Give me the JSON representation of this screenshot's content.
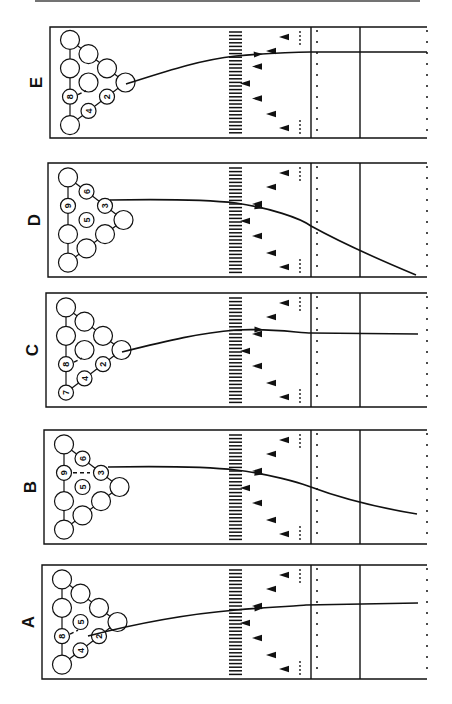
{
  "figure": {
    "top_rule": true,
    "panels": [
      {
        "id": "E",
        "label": "E",
        "top": 27,
        "bottom": 138,
        "left": 50,
        "pins_labeled": {
          "8": "8",
          "4": "4",
          "2": "2"
        },
        "pins_standing": [
          "10",
          "9",
          "8",
          "6",
          "5",
          "4",
          "3",
          "2",
          "1"
        ],
        "path": "M126,84 C170,70 200,60 236,56 C270,53 300,52 311,52 L427,52",
        "deflection": "dash 8→5"
      },
      {
        "id": "D",
        "label": "D",
        "top": 163,
        "bottom": 277,
        "left": 48,
        "pins_labeled": {
          "9": "9",
          "6": "6",
          "5": "5",
          "3": "3"
        },
        "path": "M110,200 C170,199 210,200 236,203 C270,208 300,218 311,226 C340,242 380,260 416,275",
        "deflection": "none"
      },
      {
        "id": "C",
        "label": "C",
        "top": 293,
        "bottom": 407,
        "left": 46,
        "pins_labeled": {
          "7": "7",
          "8": "8",
          "4": "4",
          "2": "2"
        },
        "path": "M122,352 C170,340 200,333 236,330 C270,328 300,333 311,333 L418,334",
        "deflection": "dash 8 tick"
      },
      {
        "id": "B",
        "label": "B",
        "top": 430,
        "bottom": 544,
        "left": 44,
        "pins_labeled": {
          "9": "9",
          "6": "6",
          "5": "5",
          "3": "3"
        },
        "path": "M108,467 C170,466 210,467 236,470 C270,474 300,483 308,486 C340,498 380,508 417,514",
        "deflection": "dash 9→3"
      },
      {
        "id": "A",
        "label": "A",
        "top": 565,
        "bottom": 679,
        "left": 42,
        "pins_labeled": {
          "8": "8",
          "5": "5",
          "4": "4",
          "2": "2"
        },
        "path": "M88,636 C150,620 200,613 236,610 C270,607 300,606 306,605 L418,603",
        "deflection": "dash 8→2"
      }
    ]
  }
}
